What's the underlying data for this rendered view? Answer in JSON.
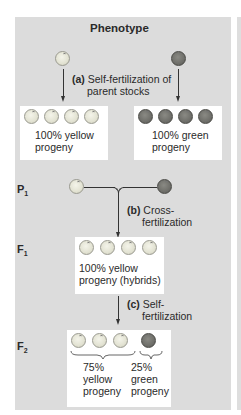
{
  "header": {
    "title": "Phenotype"
  },
  "steps": {
    "a": {
      "label": "(a)",
      "text_line1": "Self-fertilization of",
      "text_line2": "parent stocks"
    },
    "b": {
      "label": "(b)",
      "text_line1": "Cross-",
      "text_line2": "fertilization"
    },
    "c": {
      "label": "(c)",
      "text_line1": "Self-",
      "text_line2": "fertilization"
    }
  },
  "parents_self": {
    "yellow": {
      "line1": "100% yellow",
      "line2": "progeny",
      "pea_count": 4,
      "color": "yellow"
    },
    "green": {
      "line1": "100% green",
      "line2": "progeny",
      "pea_count": 4,
      "color": "green"
    }
  },
  "generations": {
    "p1": {
      "label": "P",
      "sub": "1"
    },
    "f1": {
      "label": "F",
      "sub": "1",
      "line1": "100% yellow",
      "line2": "progeny (hybrids)",
      "pea_count": 4
    },
    "f2": {
      "label": "F",
      "sub": "2",
      "yellow": {
        "pct": "75%",
        "line2": "yellow",
        "line3": "progeny",
        "pea_count": 3
      },
      "green": {
        "pct": "25%",
        "line2": "green",
        "line3": "progeny",
        "pea_count": 1
      }
    }
  },
  "colors": {
    "panel_bg": "#dcdcdc",
    "yellow_pea": "#e6e6d8",
    "green_pea": "#6f6f6a"
  }
}
